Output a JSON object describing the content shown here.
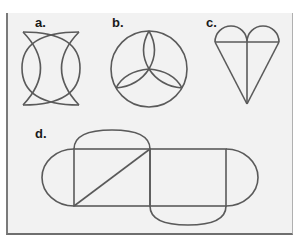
{
  "figures": {
    "a": {
      "label": "a.",
      "shape": "two-interlocking-crescents"
    },
    "b": {
      "label": "b.",
      "shape": "circle-with-three-lens-petals"
    },
    "c": {
      "label": "c.",
      "shape": "heart-cone-with-cross"
    },
    "d": {
      "label": "d.",
      "shape": "two-rectangles-with-four-semicircles-and-diagonal"
    }
  },
  "colors": {
    "panel_background": "#f2f2f2",
    "stroke": "#5a5a5a",
    "label": "#1a1a1a"
  }
}
